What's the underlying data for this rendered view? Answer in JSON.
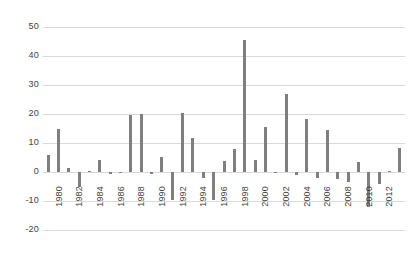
{
  "chart_data": {
    "type": "bar",
    "title": "",
    "subtitle": "",
    "xlabel": "",
    "ylabel": "",
    "grid": true,
    "legend": false,
    "bar_color": "#7f7f7f",
    "gridline_color": "#d9d9d9",
    "ylim": [
      -30,
      50
    ],
    "yticks": [
      50,
      40,
      30,
      20,
      10,
      0,
      -10,
      -20
    ],
    "ytick_labels": [
      "50",
      "40",
      "30",
      "20",
      "10",
      "0",
      "-10",
      "-20"
    ],
    "xtick_labels": [
      "1980",
      "1982",
      "1984",
      "1986",
      "1988",
      "1990",
      "1992",
      "1994",
      "1996",
      "1998",
      "2000",
      "2002",
      "2004",
      "2006",
      "2008",
      "2010",
      "2012"
    ],
    "categories": [
      "1979",
      "1980",
      "1981",
      "1982",
      "1983",
      "1984",
      "1985",
      "1986",
      "1987",
      "1988",
      "1989",
      "1990",
      "1991",
      "1992",
      "1993",
      "1994",
      "1995",
      "1996",
      "1997",
      "1998",
      "1999",
      "2000",
      "2001",
      "2002",
      "2003",
      "2004",
      "2005",
      "2006",
      "2007",
      "2008",
      "2009",
      "2010",
      "2011",
      "2012",
      "2013"
    ],
    "values": [
      6.0,
      14.7,
      1.4,
      -5.2,
      0.2,
      4.2,
      -0.6,
      -0.4,
      19.8,
      19.9,
      -0.6,
      5.2,
      -9.6,
      20.3,
      11.6,
      -2.0,
      -9.8,
      3.9,
      8.0,
      45.6,
      4.3,
      15.5,
      -0.4,
      26.8,
      -1.0,
      18.3,
      -2.2,
      14.5,
      -2.4,
      -3.6,
      3.4,
      -11.9,
      -4.0,
      0.3,
      8.2
    ]
  }
}
